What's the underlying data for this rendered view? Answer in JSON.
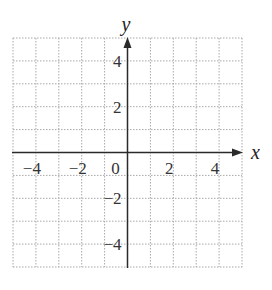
{
  "chart_data": {
    "type": "scatter",
    "title": "",
    "xlabel": "x",
    "ylabel": "y",
    "xlim": [
      -5,
      5
    ],
    "ylim": [
      -5,
      5
    ],
    "grid": true,
    "grid_style": "dotted",
    "grid_step": 1,
    "x_ticks": [
      -4,
      -2,
      0,
      2,
      4
    ],
    "y_ticks": [
      4,
      2,
      -2,
      -4
    ],
    "x_tick_labels": [
      "−4",
      "−2",
      "0",
      "2",
      "4"
    ],
    "y_tick_labels": [
      "4",
      "2",
      "−2",
      "−4"
    ],
    "series": [],
    "legend": null
  },
  "colors": {
    "axis": "#2a2a2a",
    "grid": "#a8a8a8",
    "background": "#ffffff"
  }
}
